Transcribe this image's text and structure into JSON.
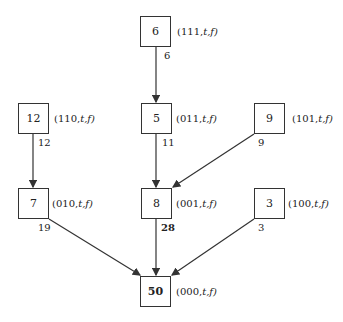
{
  "diagram": {
    "nodes": [
      {
        "id": "n6",
        "value": "6",
        "state": "111",
        "tag": "(111,",
        "tail": "t,f)",
        "x": 140,
        "y": 16,
        "bold": false
      },
      {
        "id": "n12",
        "value": "12",
        "state": "110",
        "tag": "(110,",
        "tail": "t,f)",
        "x": 18,
        "y": 103,
        "bold": false
      },
      {
        "id": "n5",
        "value": "5",
        "state": "011",
        "tag": "(011,",
        "tail": "t,f)",
        "x": 141,
        "y": 103,
        "bold": false
      },
      {
        "id": "n9",
        "value": "9",
        "state": "101",
        "tag": "(101,",
        "tail": "t,f)",
        "x": 254,
        "y": 103,
        "bold": false
      },
      {
        "id": "n7",
        "value": "7",
        "state": "010",
        "tag": "(010,",
        "tail": "t,f)",
        "x": 18,
        "y": 188,
        "bold": false
      },
      {
        "id": "n8",
        "value": "8",
        "state": "001",
        "tag": "(001,",
        "tail": "t,f)",
        "x": 141,
        "y": 188,
        "bold": false
      },
      {
        "id": "n3",
        "value": "3",
        "state": "100",
        "tag": "(100,",
        "tail": "t,f)",
        "x": 254,
        "y": 188,
        "bold": false
      },
      {
        "id": "n50",
        "value": "50",
        "state": "000",
        "tag": "(000,",
        "tail": "t,f)",
        "x": 140,
        "y": 276,
        "bold": true
      }
    ],
    "edges": [
      {
        "from": "n6",
        "to": "n5",
        "label": "6",
        "bold": false
      },
      {
        "from": "n12",
        "to": "n7",
        "label": "12",
        "bold": false
      },
      {
        "from": "n5",
        "to": "n8",
        "label": "11",
        "bold": false
      },
      {
        "from": "n9",
        "to": "n8",
        "label": "9",
        "bold": false
      },
      {
        "from": "n7",
        "to": "n50",
        "label": "19",
        "bold": false
      },
      {
        "from": "n8",
        "to": "n50",
        "label": "28",
        "bold": true
      },
      {
        "from": "n3",
        "to": "n50",
        "label": "3",
        "bold": false
      }
    ]
  }
}
